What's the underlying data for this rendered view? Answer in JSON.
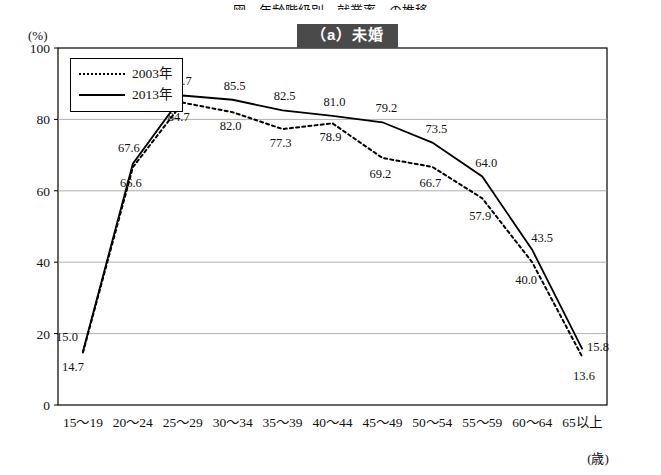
{
  "top_title_partial": "図　年齢階級別　就業率　の推移",
  "panel_title": "（a）未婚",
  "axis": {
    "y_unit": "(%)",
    "x_unit": "(歳)",
    "y_ticks": [
      0,
      20,
      40,
      60,
      80,
      100
    ],
    "y_min": 0,
    "y_max": 100
  },
  "legend": {
    "items": [
      {
        "label": "2003年",
        "style": "dashed"
      },
      {
        "label": "2013年",
        "style": "solid"
      }
    ]
  },
  "chart_data": {
    "type": "line",
    "title": "（a）未婚",
    "xlabel": "(歳)",
    "ylabel": "(%)",
    "ylim": [
      0,
      100
    ],
    "grid": true,
    "legend_position": "top-left",
    "categories": [
      "15～19",
      "20～24",
      "25～29",
      "30～34",
      "35～39",
      "40～44",
      "45～49",
      "50～54",
      "55～59",
      "60～64",
      "65以上"
    ],
    "series": [
      {
        "name": "2003年",
        "style": "dashed",
        "values": [
          14.7,
          66.6,
          84.7,
          82.0,
          77.3,
          78.9,
          69.2,
          66.7,
          57.9,
          40.0,
          13.6
        ]
      },
      {
        "name": "2013年",
        "style": "solid",
        "values": [
          15.0,
          67.6,
          86.7,
          85.5,
          82.5,
          81.0,
          79.2,
          73.5,
          64.0,
          43.5,
          15.8
        ]
      }
    ],
    "data_labels": {
      "2013年": [
        "15.0",
        "67.6",
        "86.7",
        "85.5",
        "82.5",
        "81.0",
        "79.2",
        "73.5",
        "64.0",
        "43.5",
        "15.8"
      ],
      "2003年": [
        "14.7",
        "66.6",
        "84.7",
        "82.0",
        "77.3",
        "78.9",
        "69.2",
        "66.7",
        "57.9",
        "40.0",
        "13.6"
      ]
    }
  },
  "colors": {
    "line": "#000000",
    "grid": "#9a9a9a",
    "title_bg": "#4a4a4a",
    "title_fg": "#ffffff"
  }
}
